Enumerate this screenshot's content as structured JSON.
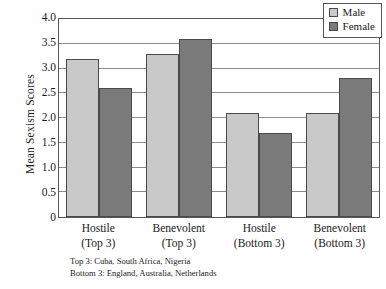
{
  "chart_data": {
    "type": "bar",
    "title": "",
    "xlabel": "",
    "ylabel": "Mean Sexism Scores",
    "ylim": [
      0,
      4.0
    ],
    "yticks": [
      "0",
      "0.5",
      "1.0",
      "1.5",
      "2.0",
      "2.5",
      "3.0",
      "3.5",
      "4.0"
    ],
    "ytick_values": [
      0,
      0.5,
      1.0,
      1.5,
      2.0,
      2.5,
      3.0,
      3.5,
      4.0
    ],
    "grid": "horizontal",
    "legend_position": "top-right",
    "categories": [
      "Hostile\n(Top 3)",
      "Benevolent\n(Top 3)",
      "Hostile\n(Bottom 3)",
      "Benevolent\n(Bottom 3)"
    ],
    "category_lines": [
      {
        "line1": "Hostile",
        "line2": "(Top 3)"
      },
      {
        "line1": "Benevolent",
        "line2": "(Top 3)"
      },
      {
        "line1": "Hostile",
        "line2": "(Bottom 3)"
      },
      {
        "line1": "Benevolent",
        "line2": "(Bottom 3)"
      }
    ],
    "series": [
      {
        "name": "Male",
        "color": "#c9c9c9",
        "values": [
          3.2,
          3.3,
          2.1,
          2.1
        ]
      },
      {
        "name": "Female",
        "color": "#7a7a7a",
        "values": [
          2.6,
          3.6,
          1.7,
          2.8
        ]
      }
    ],
    "annotations": [
      "Top 3: Cuba, South Africa, Nigeria",
      "Bottom 3: England, Australia, Netherlands"
    ]
  },
  "legend": {
    "items": [
      {
        "label": "Male"
      },
      {
        "label": "Female"
      }
    ]
  },
  "footnote": {
    "line1": "Top 3: Cuba, South Africa, Nigeria",
    "line2": "Bottom 3: England, Australia, Netherlands"
  }
}
